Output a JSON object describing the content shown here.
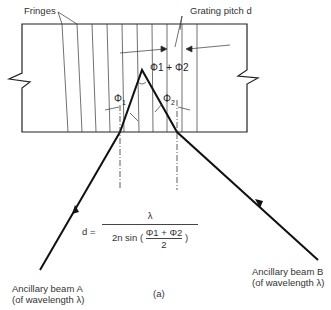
{
  "labels": {
    "fringes": "Fringes",
    "grating_pitch": "Grating pitch d",
    "phi_sum": "Φ1 + Φ2",
    "phi1": "Φ",
    "phi1_sub": "1",
    "phi2": "Φ",
    "phi2_sub": "2",
    "beam_a_line1": "Ancillary beam A",
    "beam_a_line2": "(of wavelength λ)",
    "beam_b_line1": "Ancillary beam B",
    "beam_b_line2": "(of wavelength λ)",
    "caption": "(a)"
  },
  "formula": {
    "lhs": "d =",
    "numerator": "λ",
    "denominator_prefix": "2n sin (",
    "inner_numerator": "Φ1 + Φ2",
    "inner_denominator": "2",
    "denominator_suffix": ")"
  },
  "colors": {
    "line": "#222222",
    "text": "#333333",
    "background": "#ffffff"
  }
}
